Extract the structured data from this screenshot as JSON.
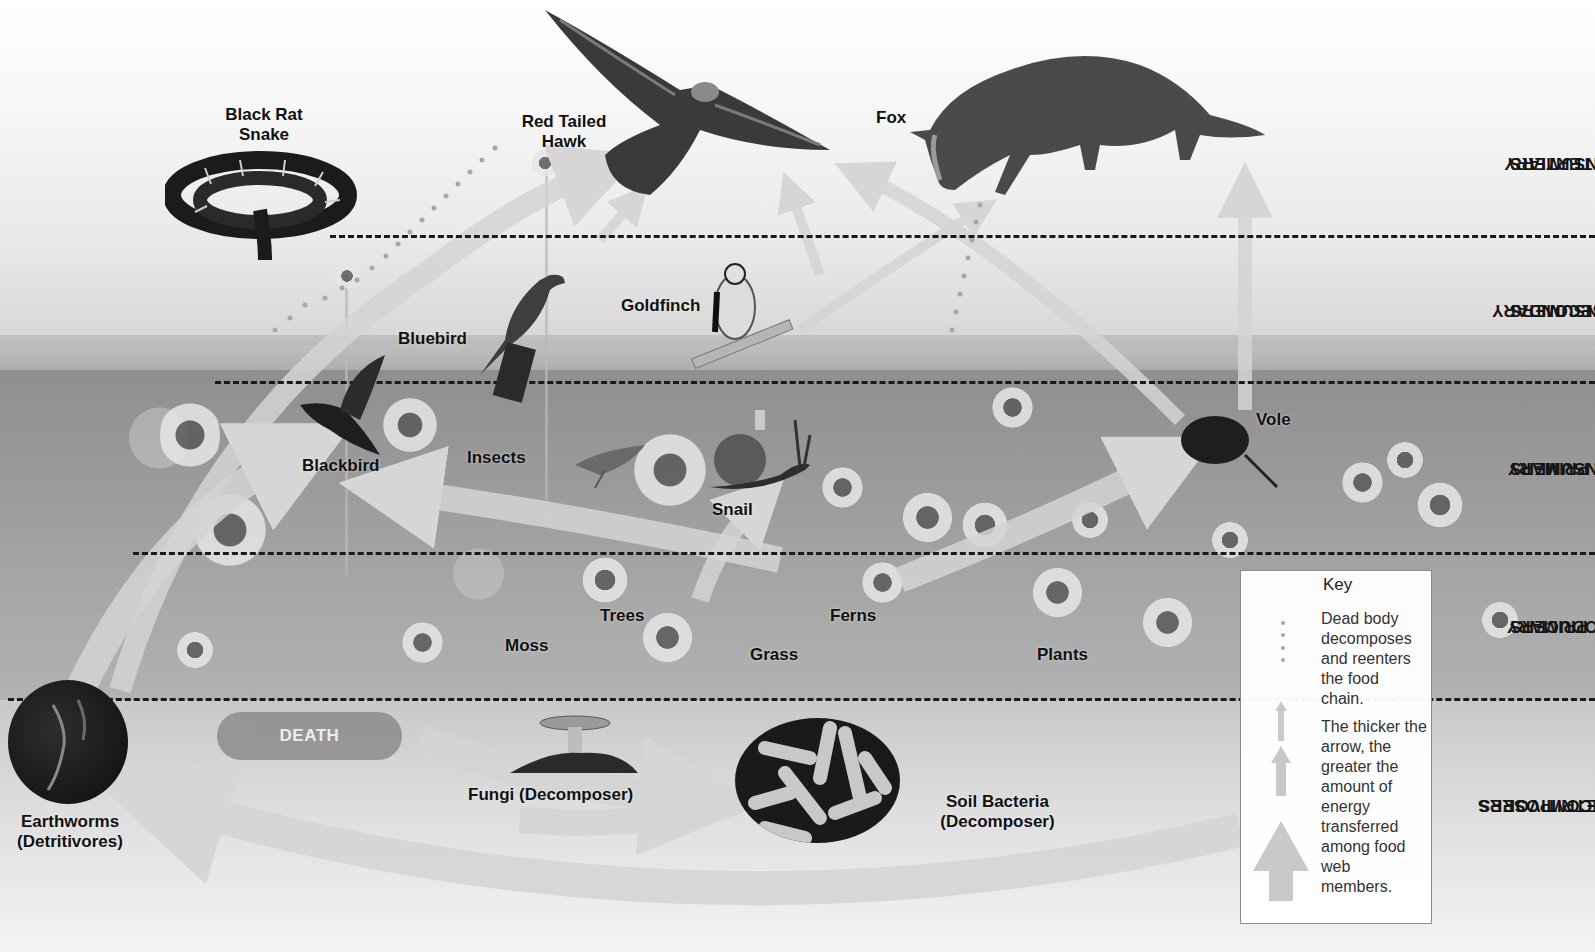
{
  "diagram": {
    "title_hidden": "Grassland food web",
    "trophic_levels": [
      {
        "id": "tertiary",
        "line1": "TERTIARY",
        "line2": "CONSUMERS"
      },
      {
        "id": "secondary",
        "line1": "SECONDARY",
        "line2": "CONSUMERS"
      },
      {
        "id": "primary_consumers",
        "line1": "PRIMARY",
        "line2": "CONSUMERS"
      },
      {
        "id": "primary_producers",
        "line1": "PRIMARY",
        "line2": "PRODUCERS"
      },
      {
        "id": "decomposers",
        "line1": "DECOMPOSERS",
        "line2": "AND DETRITIVORES"
      }
    ],
    "organisms": {
      "snake": {
        "line1": "Black Rat",
        "line2": "Snake"
      },
      "hawk": {
        "line1": "Red Tailed",
        "line2": "Hawk"
      },
      "fox": "Fox",
      "bluebird": "Bluebird",
      "goldfinch": "Goldfinch",
      "blackbird": "Blackbird",
      "insects": "Insects",
      "snail": "Snail",
      "vole": "Vole",
      "trees": "Trees",
      "ferns": "Ferns",
      "moss": "Moss",
      "grass": "Grass",
      "plants": "Plants",
      "earthworms": {
        "line1": "Earthworms",
        "line2": "(Detritivores)"
      },
      "fungi": "Fungi (Decomposer)",
      "bacteria": {
        "line1": "Soil Bacteria",
        "line2": "(Decomposer)"
      }
    },
    "death_label": "DEATH",
    "key": {
      "title": "Key",
      "dotted_text": [
        "Dead body",
        "decomposes",
        "and reenters",
        "the food",
        "chain."
      ],
      "arrow_text": [
        "The thicker the",
        "arrow, the",
        "greater the",
        "amount of",
        "energy",
        "transferred",
        "among food",
        "web",
        "members."
      ]
    },
    "colors": {
      "dashed_line": "#1a1a1a",
      "arrow_fill": "#d0d0d0",
      "dot": "#a8a8a8",
      "label_text": "#111111",
      "death_pill": "#8c8c8c"
    }
  }
}
